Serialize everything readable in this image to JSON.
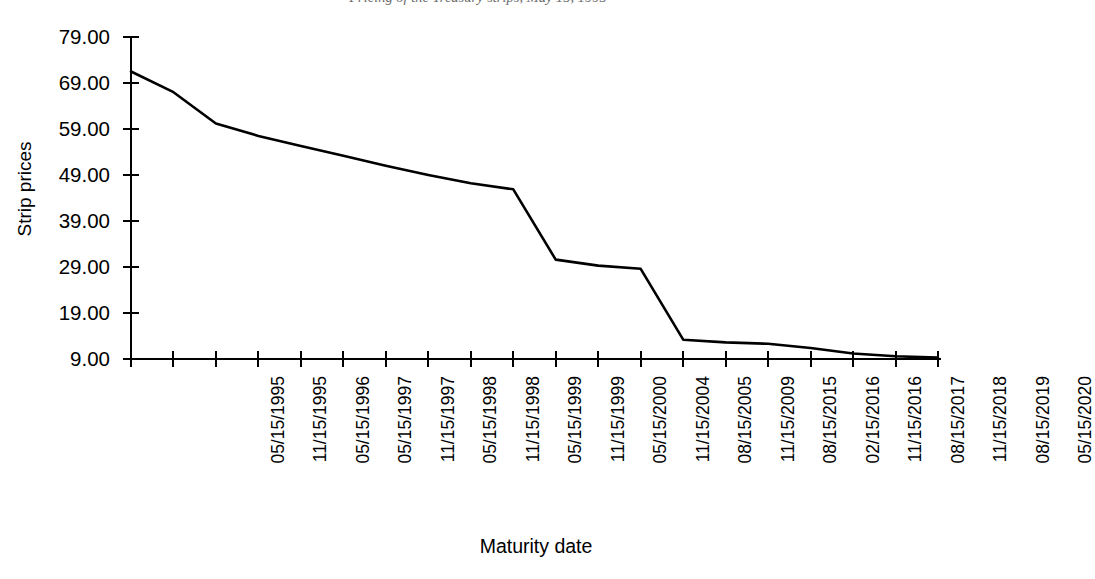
{
  "figure": {
    "title_partial": "Pricing of the Treasury strips, May 15, 1995",
    "title_visible_note": "cropped at top edge",
    "background_color": "#ffffff",
    "line_color": "#000000",
    "axis_color": "#000000"
  },
  "chart_data": {
    "type": "line",
    "title": "Pricing of the Treasury strips, May 15, 1995",
    "xlabel": "Maturity date",
    "ylabel": "Strip prices",
    "grid": false,
    "legend": null,
    "ylim": [
      9.0,
      79.0
    ],
    "yticks": [
      "79.00",
      "69.00",
      "59.00",
      "49.00",
      "39.00",
      "29.00",
      "19.00",
      "9.00"
    ],
    "ytick_values": [
      79.0,
      69.0,
      59.0,
      49.0,
      39.0,
      29.0,
      19.0,
      9.0
    ],
    "categories": [
      "05/15/1995",
      "11/15/1995",
      "05/15/1996",
      "05/15/1997",
      "11/15/1997",
      "05/15/1998",
      "11/15/1998",
      "05/15/1999",
      "11/15/1999",
      "05/15/2000",
      "11/15/2004",
      "08/15/2005",
      "11/15/2009",
      "08/15/2015",
      "02/15/2016",
      "11/15/2016",
      "08/15/2017",
      "11/15/2018",
      "08/15/2019",
      "05/15/2020"
    ],
    "values": [
      71.5,
      67.0,
      60.2,
      57.5,
      55.3,
      53.2,
      51.0,
      49.0,
      47.2,
      45.9,
      30.6,
      29.3,
      28.6,
      13.2,
      12.6,
      12.3,
      11.4,
      10.2,
      9.6,
      9.3
    ]
  }
}
